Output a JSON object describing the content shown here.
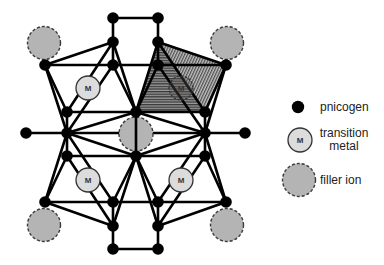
{
  "diagram": {
    "pnicogen_radius": 5.8,
    "nodes": {
      "T1": [
        113,
        18
      ],
      "T2": [
        158,
        18
      ],
      "A1": [
        113,
        42
      ],
      "A2": [
        158,
        42
      ],
      "B1": [
        45,
        65
      ],
      "B2": [
        113,
        65
      ],
      "B3": [
        158,
        65
      ],
      "B4": [
        226,
        65
      ],
      "C1": [
        67,
        112
      ],
      "C2": [
        136,
        112
      ],
      "C3": [
        205,
        112
      ],
      "D0": [
        26,
        133
      ],
      "D1": [
        67,
        133
      ],
      "D3": [
        205,
        133
      ],
      "D4": [
        245,
        133
      ],
      "E1": [
        67,
        156
      ],
      "E2": [
        136,
        156
      ],
      "E3": [
        205,
        156
      ],
      "F1": [
        45,
        202
      ],
      "F2": [
        113,
        202
      ],
      "F3": [
        158,
        202
      ],
      "F4": [
        226,
        202
      ],
      "G1": [
        113,
        226
      ],
      "G2": [
        158,
        226
      ],
      "H1": [
        113,
        249
      ],
      "H2": [
        158,
        249
      ]
    },
    "bonds": [
      [
        "T1",
        "T2"
      ],
      [
        "H1",
        "H2"
      ],
      [
        "B2",
        "B3"
      ],
      [
        "F2",
        "F3"
      ],
      [
        "D1",
        "D3"
      ],
      [
        "T1",
        "A1"
      ],
      [
        "A1",
        "B2"
      ],
      [
        "A1",
        "B1"
      ],
      [
        "B1",
        "B2"
      ],
      [
        "A1",
        "C1"
      ],
      [
        "A1",
        "C2"
      ],
      [
        "B1",
        "C1"
      ],
      [
        "B1",
        "D1"
      ],
      [
        "B2",
        "C2"
      ],
      [
        "B2",
        "D1"
      ],
      [
        "C1",
        "C2"
      ],
      [
        "C1",
        "D1"
      ],
      [
        "D0",
        "D1"
      ],
      [
        "D1",
        "C2"
      ],
      [
        "T2",
        "A2"
      ],
      [
        "A2",
        "B3"
      ],
      [
        "A2",
        "B4"
      ],
      [
        "B4",
        "B3"
      ],
      [
        "A2",
        "C3"
      ],
      [
        "A2",
        "C2"
      ],
      [
        "B4",
        "C3"
      ],
      [
        "B4",
        "D3"
      ],
      [
        "B3",
        "C2"
      ],
      [
        "B3",
        "D3"
      ],
      [
        "C3",
        "C2"
      ],
      [
        "C3",
        "D3"
      ],
      [
        "D4",
        "D3"
      ],
      [
        "D3",
        "C2"
      ],
      [
        "H1",
        "G1"
      ],
      [
        "G1",
        "F2"
      ],
      [
        "G1",
        "F1"
      ],
      [
        "F1",
        "F2"
      ],
      [
        "G1",
        "E1"
      ],
      [
        "G1",
        "E2"
      ],
      [
        "F1",
        "E1"
      ],
      [
        "F1",
        "D1"
      ],
      [
        "F2",
        "E2"
      ],
      [
        "F2",
        "D1"
      ],
      [
        "E1",
        "E2"
      ],
      [
        "E1",
        "D1"
      ],
      [
        "D1",
        "E2"
      ],
      [
        "H2",
        "G2"
      ],
      [
        "G2",
        "F3"
      ],
      [
        "G2",
        "F4"
      ],
      [
        "F4",
        "F3"
      ],
      [
        "G2",
        "E3"
      ],
      [
        "G2",
        "E2"
      ],
      [
        "F4",
        "E3"
      ],
      [
        "F4",
        "D3"
      ],
      [
        "F3",
        "E2"
      ],
      [
        "F3",
        "D3"
      ],
      [
        "E3",
        "E2"
      ],
      [
        "E3",
        "D3"
      ],
      [
        "D3",
        "E2"
      ]
    ],
    "bonds_over_filler": [
      [
        "C2",
        "E2"
      ]
    ],
    "filler_ions": [
      {
        "x": 44,
        "y": 43,
        "r": 16.5
      },
      {
        "x": 227,
        "y": 43,
        "r": 16.5
      },
      {
        "x": 136,
        "y": 134,
        "r": 17
      },
      {
        "x": 44,
        "y": 225,
        "r": 16.5
      },
      {
        "x": 227,
        "y": 225,
        "r": 16.5
      }
    ],
    "transition_metals": [
      {
        "x": 88,
        "y": 88,
        "r": 12,
        "label": "M",
        "highlighted": false
      },
      {
        "x": 181,
        "y": 88,
        "r": 12,
        "label": "M",
        "highlighted": true
      },
      {
        "x": 88,
        "y": 180,
        "r": 12,
        "label": "M",
        "highlighted": false
      },
      {
        "x": 181,
        "y": 180,
        "r": 12,
        "label": "M",
        "highlighted": false
      }
    ],
    "highlighted_tetrahedron": {
      "faces": [
        {
          "vertices": [
            "A2",
            "C2",
            "C3"
          ],
          "hatch": "h"
        },
        {
          "vertices": [
            "A2",
            "B4",
            "C3"
          ],
          "hatch": "d"
        }
      ]
    }
  },
  "legend": {
    "pnicogen": {
      "label": "pnicogen"
    },
    "transition_metal": {
      "symbol_text": "M",
      "label_line1": "transition",
      "label_line2": "metal"
    },
    "filler_ion": {
      "label": "filler ion"
    }
  },
  "colors": {
    "bond": "#000000",
    "pnicogen": "#000000",
    "metal_fill": "#dcdcdc",
    "metal_outline": "#333333",
    "metal_highlight_fill": "rgba(90,90,90,0.35)",
    "filler_fill": "#b4b4b4",
    "filler_outline": "#3a3a3a"
  }
}
